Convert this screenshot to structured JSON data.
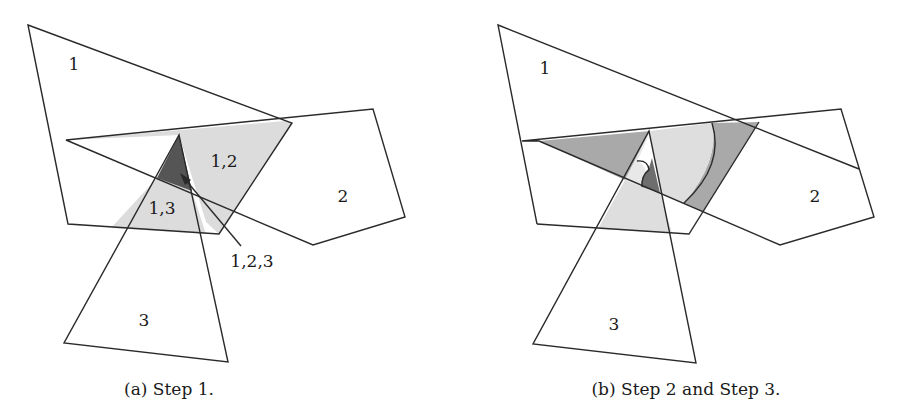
{
  "figure": {
    "panels": [
      {
        "id": "a",
        "caption": "(a) Step 1.",
        "caption_pos": [
          169,
          395
        ],
        "polygons": [
          {
            "name": "polygon-1",
            "points": "28,25 292,123 219,234 68,224"
          },
          {
            "name": "polygon-2",
            "points": "66,140 373,109 405,217 313,245"
          },
          {
            "name": "polygon-3",
            "points": "179,135 228,362 64,343"
          }
        ],
        "regions": [
          {
            "name": "region-1-2-light",
            "points": "66,140 285,121 292,123 219,234 206,222 179,135",
            "fill": "#dcdcdc"
          },
          {
            "name": "region-1-3-light",
            "points": "157,178 192,191 206,234 111,228",
            "fill": "#dcdcdc"
          },
          {
            "name": "region-1-2-3-dark",
            "points": "179,135 157,178 192,191",
            "fill": "#555555"
          }
        ],
        "labels": [
          {
            "name": "label-1",
            "text": "1",
            "x": 74,
            "y": 70
          },
          {
            "name": "label-1-2",
            "text": "1,2",
            "x": 224,
            "y": 167
          },
          {
            "name": "label-1-3",
            "text": "1,3",
            "x": 162,
            "y": 214
          },
          {
            "name": "label-2",
            "text": "2",
            "x": 343,
            "y": 202
          },
          {
            "name": "label-3",
            "text": "3",
            "x": 144,
            "y": 326
          },
          {
            "name": "label-1-2-3",
            "text": "1,2,3",
            "x": 252,
            "y": 267
          }
        ],
        "arrow": {
          "from": [
            241,
            246
          ],
          "to": [
            182,
            176
          ]
        }
      },
      {
        "id": "b",
        "caption": "(b) Step 2 and Step 3.",
        "caption_pos": [
          686,
          395
        ],
        "polygons": [
          {
            "name": "polygon-1-extended",
            "points": "498,25 859,169"
          },
          {
            "name": "polygon-2",
            "points": "522,141 841,109 874,217 780,245 539,141"
          },
          {
            "name": "polygon-3",
            "points": "649,131 696,363 533,344"
          }
        ],
        "regions": [
          {
            "name": "region-band-dark-left",
            "points": "539,141 649,131 625,180",
            "fill": "#a9a9a9"
          },
          {
            "name": "region-band-dark-right",
            "points": "712,123 759,122 703,212 684,203",
            "fill": "#a9a9a9"
          },
          {
            "name": "region-light-center",
            "points": "649,131 712,123 684,203 660,193",
            "fill": "#dedede"
          },
          {
            "name": "region-light-lower",
            "points": "625,180 660,193 672,233 597,229",
            "fill": "#dedede"
          },
          {
            "name": "region-light-small",
            "points": "649,131 637,162 646,175 625,180",
            "fill": "#e6e6e6"
          },
          {
            "name": "region-dark-core",
            "points": "648,170 660,193 641,187",
            "fill": "#6e6e6e"
          }
        ],
        "labels": [
          {
            "name": "label-1",
            "text": "1",
            "x": 545,
            "y": 74
          },
          {
            "name": "label-2",
            "text": "2",
            "x": 815,
            "y": 202
          },
          {
            "name": "label-3",
            "text": "3",
            "x": 614,
            "y": 330
          }
        ]
      }
    ]
  }
}
